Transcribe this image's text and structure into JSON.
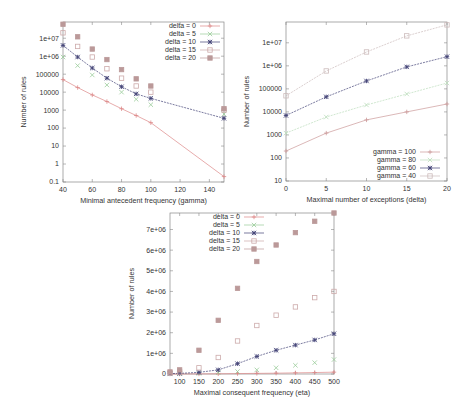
{
  "chart_data": [
    {
      "type": "scatter",
      "title": "",
      "xlabel": "Minimal antecedent frequency (gamma)",
      "ylabel": "Number of rules",
      "yscale": "log",
      "xlim": [
        40,
        150
      ],
      "ylim": [
        0.1,
        80000000
      ],
      "xticks": [
        "40",
        "60",
        "80",
        "100",
        "120",
        "140"
      ],
      "yticks": [
        "0.1",
        "1",
        "10",
        "100",
        "1000",
        "10000",
        "100000",
        "1e+06",
        "1e+07"
      ],
      "legend_position": "top-right",
      "series": [
        {
          "name": "delta = 0",
          "style": "line+points",
          "x": [
            40,
            50,
            60,
            70,
            80,
            90,
            100,
            150
          ],
          "values": [
            50000,
            18000,
            7000,
            3000,
            1200,
            500,
            200,
            0.2
          ]
        },
        {
          "name": "delta = 5",
          "style": "points",
          "x": [
            40,
            50,
            60,
            70,
            80,
            90,
            100,
            150
          ],
          "values": [
            900000,
            300000,
            90000,
            25000,
            10000,
            4000,
            2000,
            600
          ]
        },
        {
          "name": "delta = 10",
          "style": "line+points",
          "x": [
            40,
            50,
            60,
            70,
            80,
            90,
            100,
            150
          ],
          "values": [
            4000000,
            900000,
            220000,
            60000,
            20000,
            8000,
            4500,
            350
          ]
        },
        {
          "name": "delta = 15",
          "style": "points",
          "x": [
            40,
            50,
            60,
            70,
            80,
            90,
            100,
            150
          ],
          "values": [
            20000000,
            3500000,
            900000,
            200000,
            60000,
            22000,
            10000,
            1000
          ]
        },
        {
          "name": "delta = 20",
          "style": "points",
          "x": [
            40,
            50,
            60,
            70,
            80,
            90,
            100,
            150
          ],
          "values": [
            60000000,
            12000000,
            2500000,
            650000,
            180000,
            55000,
            22000,
            1200
          ]
        }
      ]
    },
    {
      "type": "line",
      "title": "",
      "xlabel": "Maximal number of exceptions (delta)",
      "ylabel": "Number of rules",
      "yscale": "log",
      "xlim": [
        0,
        20
      ],
      "ylim": [
        10,
        80000000
      ],
      "xticks": [
        "0",
        "5",
        "10",
        "15",
        "20"
      ],
      "yticks": [
        "10",
        "100",
        "1000",
        "10000",
        "100000",
        "1e+06",
        "1e+07"
      ],
      "legend_position": "bottom-right",
      "series": [
        {
          "name": "gamma = 100",
          "x": [
            0,
            5,
            10,
            15,
            20
          ],
          "values": [
            200,
            1200,
            4500,
            10000,
            22000
          ]
        },
        {
          "name": "gamma = 80",
          "x": [
            0,
            5,
            10,
            15,
            20
          ],
          "values": [
            1200,
            6000,
            20000,
            60000,
            180000
          ]
        },
        {
          "name": "gamma = 60",
          "x": [
            0,
            5,
            10,
            15,
            20
          ],
          "values": [
            7000,
            45000,
            220000,
            900000,
            2500000
          ]
        },
        {
          "name": "gamma = 40",
          "x": [
            0,
            5,
            10,
            15,
            20
          ],
          "values": [
            50000,
            600000,
            4000000,
            20000000,
            60000000
          ]
        }
      ]
    },
    {
      "type": "scatter",
      "title": "",
      "xlabel": "Maximal consequent frequency (eta)",
      "ylabel": "Number of rules",
      "yscale": "linear",
      "xlim": [
        75,
        500
      ],
      "ylim": [
        0,
        7800000
      ],
      "xticks": [
        "100",
        "150",
        "200",
        "250",
        "300",
        "350",
        "400",
        "450",
        "500"
      ],
      "yticks": [
        "0",
        "1e+06",
        "2e+06",
        "3e+06",
        "4e+06",
        "5e+06",
        "6e+06",
        "7e+06"
      ],
      "legend_position": "top-left",
      "series": [
        {
          "name": "delta = 0",
          "style": "line+points",
          "x": [
            75,
            100,
            150,
            200,
            250,
            300,
            350,
            400,
            450,
            500
          ],
          "values": [
            0,
            0,
            5000,
            10000,
            20000,
            30000,
            40000,
            55000,
            70000,
            90000
          ]
        },
        {
          "name": "delta = 5",
          "style": "points",
          "x": [
            75,
            100,
            150,
            200,
            250,
            300,
            350,
            400,
            450,
            500
          ],
          "values": [
            5000,
            10000,
            30000,
            60000,
            120000,
            200000,
            300000,
            420000,
            550000,
            700000
          ]
        },
        {
          "name": "delta = 10",
          "style": "line+points",
          "x": [
            75,
            100,
            150,
            200,
            250,
            300,
            350,
            400,
            450,
            500
          ],
          "values": [
            20000,
            30000,
            80000,
            200000,
            500000,
            850000,
            1150000,
            1400000,
            1650000,
            1950000
          ]
        },
        {
          "name": "delta = 15",
          "style": "points",
          "x": [
            75,
            100,
            150,
            200,
            250,
            300,
            350,
            400,
            450,
            500
          ],
          "values": [
            50000,
            100000,
            300000,
            800000,
            1600000,
            2350000,
            2850000,
            3250000,
            3700000,
            4000000
          ]
        },
        {
          "name": "delta = 20",
          "style": "points",
          "x": [
            75,
            100,
            150,
            200,
            250,
            300,
            350,
            400,
            450,
            500
          ],
          "values": [
            100000,
            200000,
            1150000,
            2600000,
            4150000,
            5450000,
            6250000,
            6850000,
            7400000,
            7800000
          ]
        }
      ]
    }
  ]
}
